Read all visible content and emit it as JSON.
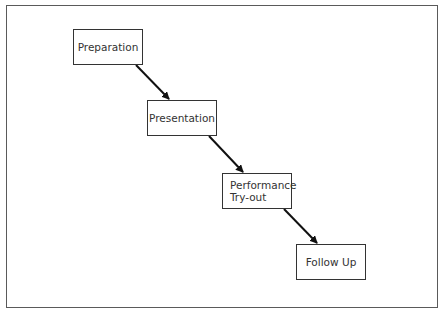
{
  "diagram": {
    "type": "flow-sequence",
    "steps": [
      {
        "label": "Preparation"
      },
      {
        "label": "Presentation"
      },
      {
        "label": "Performance\nTry-out"
      },
      {
        "label": "Follow Up"
      }
    ],
    "edges": [
      {
        "from": "Preparation",
        "to": "Presentation"
      },
      {
        "from": "Presentation",
        "to": "Performance Try-out"
      },
      {
        "from": "Performance Try-out",
        "to": "Follow Up"
      }
    ]
  }
}
